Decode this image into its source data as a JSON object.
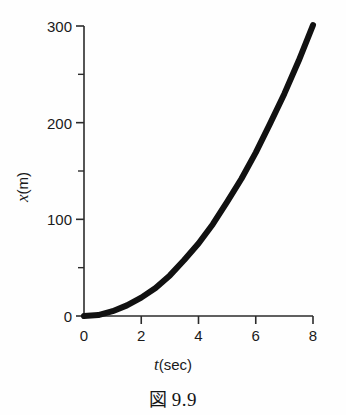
{
  "figure": {
    "caption_symbol": "図",
    "caption_number": "9.9",
    "caption_full": "図 9.9"
  },
  "axis_titles": {
    "y_variable": "x",
    "y_unit": "(m)",
    "x_variable": "t",
    "x_unit": "(sec)"
  },
  "colors": {
    "curve": "#111111",
    "axis": "#2b2b2b",
    "text": "#1a1a1a",
    "background": "#fefefe"
  },
  "chart_data": {
    "type": "line",
    "title": "",
    "subtitle": "",
    "xlabel": "t (sec)",
    "ylabel": "x (m)",
    "xlim": [
      0,
      8
    ],
    "ylim": [
      0,
      300
    ],
    "grid": false,
    "legend": "none",
    "x_ticks": [
      0,
      2,
      4,
      6,
      8
    ],
    "x_tick_labels": [
      "0",
      "2",
      "4",
      "6",
      "8"
    ],
    "x_minor_ticks": [],
    "y_ticks": [
      0,
      100,
      200,
      300
    ],
    "y_tick_labels": [
      "0",
      "100",
      "200",
      "300"
    ],
    "y_minor_ticks": [
      50,
      150,
      250
    ],
    "series": [
      {
        "name": "x(t)",
        "relation": "x = 4.7 t^2",
        "line_width_px": 6,
        "color": "#111111",
        "x": [
          0.0,
          0.5,
          1.0,
          1.5,
          2.0,
          2.5,
          3.0,
          3.5,
          4.0,
          4.5,
          5.0,
          5.5,
          6.0,
          6.5,
          7.0,
          7.5,
          8.0
        ],
        "values": [
          0,
          1,
          5,
          11,
          19,
          29,
          42,
          58,
          75,
          95,
          118,
          142,
          169,
          199,
          230,
          264,
          301
        ]
      }
    ],
    "annotations": []
  }
}
